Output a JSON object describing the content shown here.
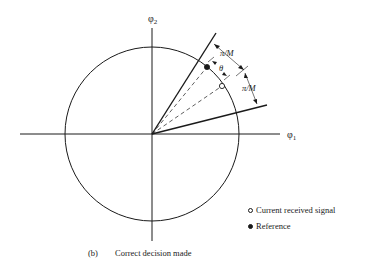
{
  "figure": {
    "axes": {
      "x_label": "φ",
      "x_label_sub": "1",
      "y_label": "φ",
      "y_label_sub": "2"
    },
    "annotations": {
      "upper_angle": "π/M",
      "lower_angle": "π/M",
      "theta": "θ"
    },
    "legend": {
      "items": [
        {
          "marker": "open-circle",
          "label": "Current received signal"
        },
        {
          "marker": "filled-circle",
          "label": "Reference"
        }
      ]
    },
    "caption": {
      "tag": "(b)",
      "text": "Correct decision made"
    },
    "colors": {
      "ink": "#1a1a1a",
      "background": "#ffffff"
    }
  }
}
